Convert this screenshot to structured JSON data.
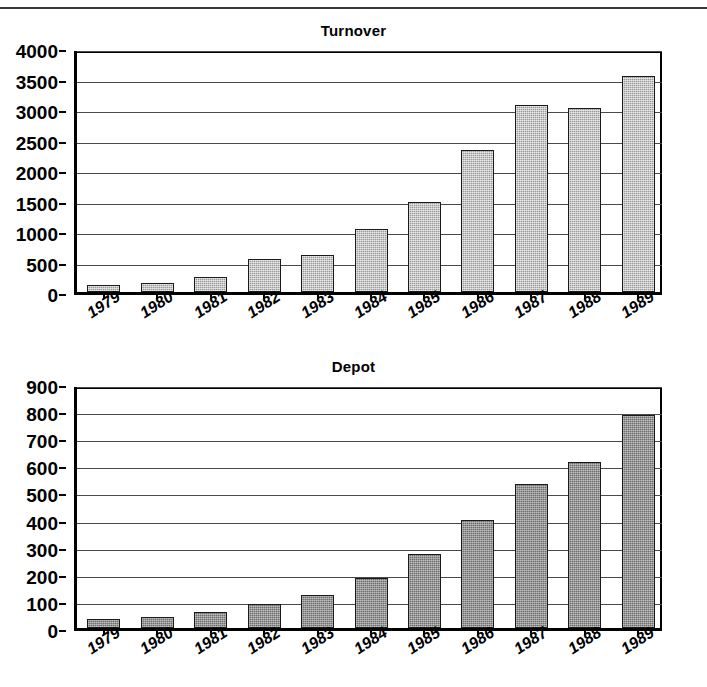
{
  "page": {
    "background": "#ffffff",
    "has_top_rule": true
  },
  "chart_data": [
    {
      "type": "bar",
      "title": "Turnover",
      "xlabel": "",
      "ylabel": "",
      "categories": [
        "1979",
        "1980",
        "1981",
        "1982",
        "1983",
        "1984",
        "1985",
        "1986",
        "1987",
        "1988",
        "1989"
      ],
      "values": [
        110,
        150,
        240,
        535,
        610,
        1025,
        1470,
        2320,
        3070,
        3010,
        3540
      ],
      "yticks": [
        0,
        500,
        1000,
        1500,
        2000,
        2500,
        3000,
        3500,
        4000
      ],
      "ytick_labels": [
        "0",
        "500",
        "1000",
        "1500",
        "2000",
        "2500",
        "3000",
        "3500",
        "4000"
      ],
      "ylim": [
        0,
        4000
      ],
      "grid": true,
      "legend": "none",
      "bar_color": "#9a9a9a",
      "bar_border_color": "#1a1a1a"
    },
    {
      "type": "bar",
      "title": "Depot",
      "xlabel": "",
      "ylabel": "",
      "categories": [
        "1979",
        "1980",
        "1981",
        "1982",
        "1983",
        "1984",
        "1985",
        "1986",
        "1987",
        "1988",
        "1989"
      ],
      "values": [
        35,
        42,
        58,
        88,
        120,
        185,
        273,
        400,
        530,
        612,
        785
      ],
      "yticks": [
        0,
        100,
        200,
        300,
        400,
        500,
        600,
        700,
        800,
        900
      ],
      "ytick_labels": [
        "0",
        "100",
        "200",
        "300",
        "400",
        "500",
        "600",
        "700",
        "800",
        "900"
      ],
      "ylim": [
        0,
        900
      ],
      "grid": true,
      "legend": "none",
      "bar_color": "#6e6e6e",
      "bar_border_color": "#1a1a1a"
    }
  ]
}
